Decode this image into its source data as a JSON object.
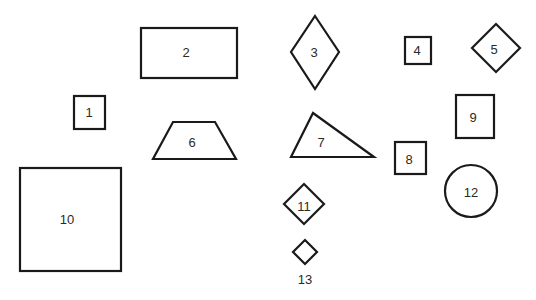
{
  "diagram": {
    "background": "#ffffff",
    "stroke_color": "#1a1a1a",
    "shapes": [
      {
        "id": "1",
        "type": "square",
        "label": "1"
      },
      {
        "id": "2",
        "type": "rectangle",
        "label": "2"
      },
      {
        "id": "3",
        "type": "rhombus",
        "label": "3"
      },
      {
        "id": "4",
        "type": "square",
        "label": "4"
      },
      {
        "id": "5",
        "type": "diamond",
        "label": "5"
      },
      {
        "id": "6",
        "type": "trapezoid",
        "label": "6"
      },
      {
        "id": "7",
        "type": "triangle",
        "label": "7"
      },
      {
        "id": "8",
        "type": "square",
        "label": "8"
      },
      {
        "id": "9",
        "type": "rectangle",
        "label": "9"
      },
      {
        "id": "10",
        "type": "square",
        "label": "10"
      },
      {
        "id": "11",
        "type": "diamond",
        "label": "11"
      },
      {
        "id": "12",
        "type": "circle",
        "label": "12"
      },
      {
        "id": "13",
        "type": "diamond",
        "label": "13"
      }
    ]
  }
}
